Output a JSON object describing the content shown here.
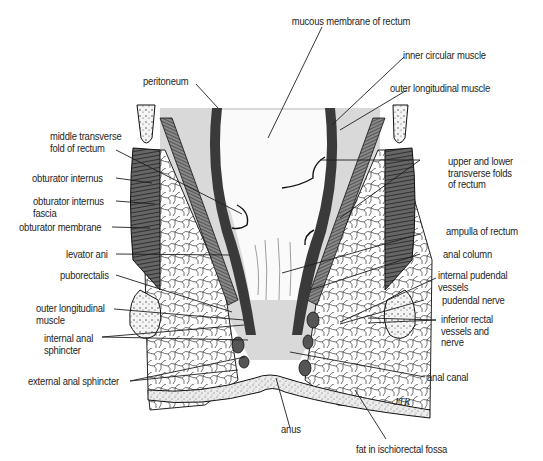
{
  "diagram": {
    "signature": "JTR",
    "labels": {
      "mucous_membrane": "mucous membrane of rectum",
      "inner_circular": "inner circular muscle",
      "outer_longitudinal_top": "outer longitudinal muscle",
      "peritoneum": "peritoneum",
      "middle_transverse_fold": "middle transverse\nfold of rectum",
      "upper_lower_folds": "upper and lower\ntransverse folds\nof rectum",
      "obturator_internus": "obturator internus",
      "obturator_internus_fascia": "obturator internus\nfascia",
      "obturator_membrane": "obturator membrane",
      "ampulla": "ampulla of rectum",
      "levator_ani": "levator ani",
      "anal_column": "anal column",
      "puborectalis": "puborectalis",
      "internal_pudendal": "internal pudendal\nvessels",
      "pudendal_nerve": "pudendal nerve",
      "outer_longitudinal_bottom": "outer longitudinal\nmuscle",
      "inferior_rectal": "inferior rectal\nvessels and\nnerve",
      "internal_anal_sphincter": "internal anal\nsphincter",
      "external_anal_sphincter": "external anal sphincter",
      "anal_canal": "anal canal",
      "anus": "anus",
      "fat_ischiorectal": "fat in ischiorectal fossa"
    },
    "colors": {
      "ink": "#1e1e1e",
      "gray_fill": "#d9d9d9",
      "muscle": "#4a4a4a",
      "background": "#ffffff"
    }
  }
}
